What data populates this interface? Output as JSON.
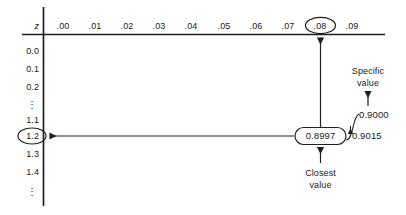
{
  "figure": {
    "kind": "z-table-lookup-diagram",
    "background": "#ffffff",
    "ink": "#231f20"
  },
  "table": {
    "corner_label": "z",
    "column_headers": [
      ".00",
      ".01",
      ".02",
      ".03",
      ".04",
      ".05",
      ".06",
      ".07",
      ".08",
      ".09"
    ],
    "highlighted_column": ".08",
    "row_headers": [
      "0.0",
      "0.1",
      "0.2",
      "⋮",
      "1.1",
      "1.2",
      "1.3",
      "1.4",
      "⋮"
    ],
    "highlighted_row": "1.2",
    "body_value": "0.8997"
  },
  "annotations": {
    "closest_value": {
      "line1": "Closest",
      "line2": "value"
    },
    "specific_value": {
      "line1": "Specific",
      "line2": "value"
    },
    "target_probability": "0.9000",
    "next_probability": "0.9015"
  }
}
